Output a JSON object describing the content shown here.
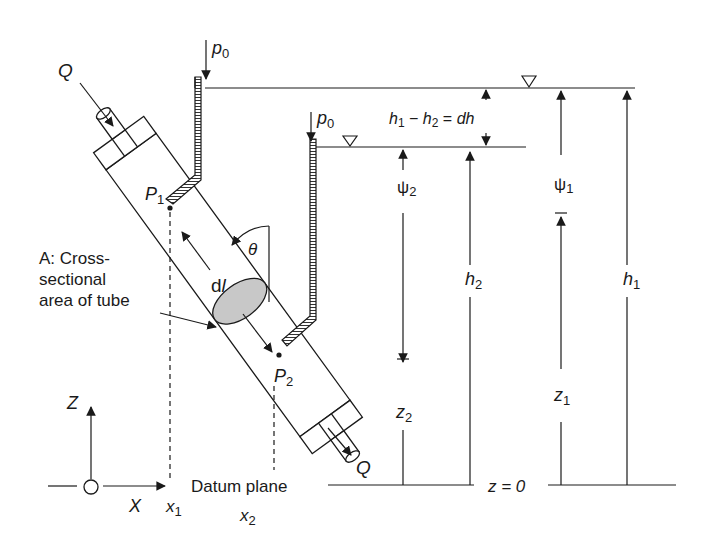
{
  "diagram": {
    "labels": {
      "flow_in": "Q",
      "flow_out": "Q",
      "p0_left": "p",
      "p0_left_sub": "0",
      "p0_right": "p",
      "p0_right_sub": "0",
      "point1": "P",
      "point1_sub": "1",
      "point2": "P",
      "point2_sub": "2",
      "angle": "θ",
      "length": "d",
      "length_italic": "l",
      "area_line1": "A: Cross-",
      "area_line2": "sectional",
      "area_line3": "area of tube",
      "head_diff_h1": "h",
      "head_diff_h1_sub": "1",
      "head_diff_minus": " − ",
      "head_diff_h2": "h",
      "head_diff_h2_sub": "2",
      "head_diff_eq": " = ",
      "head_diff_dh": "dh",
      "psi2": "ψ",
      "psi2_sub": "2",
      "psi1": "ψ",
      "psi1_sub": "1",
      "h2": "h",
      "h2_sub": "2",
      "h1": "h",
      "h1_sub": "1",
      "z2": "z",
      "z2_sub": "2",
      "z1": "z",
      "z1_sub": "1",
      "z_eq_0": "z = 0",
      "datum": "Datum plane",
      "axis_z": "Z",
      "axis_x": "X",
      "x1": "x",
      "x1_sub": "1",
      "x2": "x",
      "x2_sub": "2"
    },
    "colors": {
      "ink": "#1a1a1a",
      "area_fill": "#c8c8c8",
      "background": "#ffffff"
    }
  }
}
